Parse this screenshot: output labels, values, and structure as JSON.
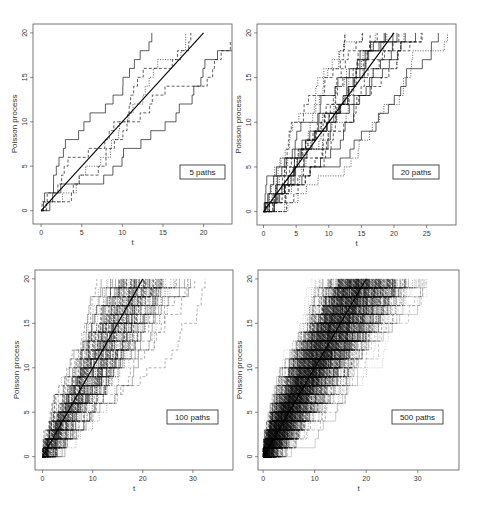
{
  "chart_data": [
    {
      "type": "line",
      "title": "",
      "legend": "5 paths",
      "n_paths": 5,
      "xlabel": "t",
      "ylabel": "Poisson process",
      "xlim": [
        -1,
        23.5
      ],
      "ylim": [
        -1.5,
        21
      ],
      "xticks": [
        0,
        5,
        10,
        15,
        20
      ],
      "yticks": [
        0,
        5,
        10,
        15,
        20
      ],
      "grid": false,
      "legend_position": "lower-right",
      "reference_line": {
        "x": [
          0,
          20
        ],
        "y": [
          0,
          20
        ]
      },
      "series": [
        {
          "name": "path 1",
          "style": "solid",
          "end_t": 16.8,
          "values_desc": "step function 0→20"
        },
        {
          "name": "path 2",
          "style": "dashed",
          "end_t": 20.6,
          "values_desc": "step function 0→20"
        },
        {
          "name": "path 3",
          "style": "solid",
          "end_t": 22.8,
          "values_desc": "step function 0→20"
        },
        {
          "name": "path 4",
          "style": "dotted",
          "end_t": 17.0,
          "values_desc": "step function 0→20"
        },
        {
          "name": "path 5",
          "style": "solid",
          "end_t": 17.9,
          "values_desc": "step function 0→20"
        }
      ]
    },
    {
      "type": "line",
      "title": "",
      "legend": "20 paths",
      "n_paths": 20,
      "xlabel": "t",
      "ylabel": "Poisson process",
      "xlim": [
        -1,
        29.5
      ],
      "ylim": [
        -1.5,
        21
      ],
      "xticks": [
        0,
        5,
        10,
        15,
        20,
        25
      ],
      "yticks": [
        0,
        5,
        10,
        15,
        20
      ],
      "grid": false,
      "legend_position": "lower-right",
      "reference_line": {
        "x": [
          0,
          20
        ],
        "y": [
          0,
          20
        ]
      }
    },
    {
      "type": "line",
      "title": "",
      "legend": "100 paths",
      "n_paths": 100,
      "xlabel": "t",
      "ylabel": "Poisson process",
      "xlim": [
        -1.5,
        38
      ],
      "ylim": [
        -1.5,
        21
      ],
      "xticks": [
        0,
        10,
        20,
        30
      ],
      "yticks": [
        0,
        5,
        10,
        15,
        20
      ],
      "grid": false,
      "legend_position": "lower-right",
      "reference_line": {
        "x": [
          0,
          20
        ],
        "y": [
          0,
          20
        ]
      }
    },
    {
      "type": "line",
      "title": "",
      "legend": "500 paths",
      "n_paths": 500,
      "xlabel": "t",
      "ylabel": "Poisson process",
      "xlim": [
        -1,
        38
      ],
      "ylim": [
        -1.5,
        21
      ],
      "xticks": [
        0,
        10,
        20,
        30
      ],
      "yticks": [
        0,
        5,
        10,
        15,
        20
      ],
      "grid": false,
      "legend_position": "lower-right",
      "reference_line": {
        "x": [
          0,
          20
        ],
        "y": [
          0,
          20
        ]
      }
    }
  ],
  "panels": [
    {
      "legend": "5 paths",
      "xlabel": "t",
      "ylabel": "Poisson process",
      "box": [
        33,
        24,
        232,
        224
      ],
      "legend_box": [
        180,
        165,
        45,
        14
      ]
    },
    {
      "legend": "20 paths",
      "xlabel": "t",
      "ylabel": "Poisson process",
      "box": [
        257,
        24,
        456,
        225
      ],
      "legend_box": [
        393,
        165,
        46,
        14
      ]
    },
    {
      "legend": "100 paths",
      "xlabel": "t",
      "ylabel": "Poisson process",
      "box": [
        35,
        270,
        233,
        470
      ],
      "legend_box": [
        167,
        410,
        51,
        14
      ]
    },
    {
      "legend": "500 paths",
      "xlabel": "t",
      "ylabel": "Poisson process",
      "box": [
        258,
        270,
        459,
        470
      ],
      "legend_box": [
        392,
        410,
        51,
        14
      ]
    }
  ]
}
